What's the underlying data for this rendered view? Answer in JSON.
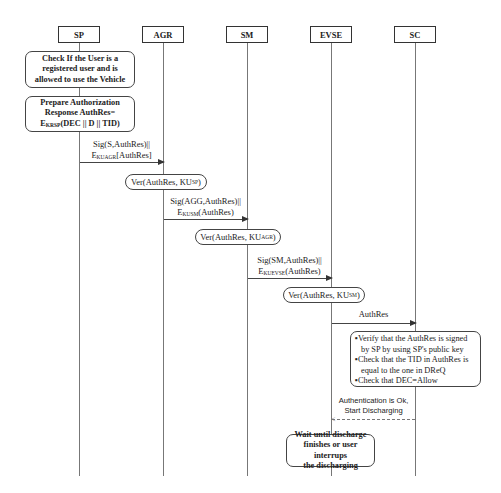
{
  "actors": [
    {
      "id": "SP",
      "label": "SP"
    },
    {
      "id": "AGR",
      "label": "AGR"
    },
    {
      "id": "SM",
      "label": "SM"
    },
    {
      "id": "EVSE",
      "label": "EVSE"
    },
    {
      "id": "SC",
      "label": "SC"
    }
  ],
  "sp_steps": {
    "check_user": "Check If the User is a registered user and is allowed to use the Vehicle",
    "check_user_lines": [
      "Check If the User is a",
      "registered user and is",
      "allowed to use the Vehicle"
    ],
    "prepare_lines": [
      "Prepare Authorization",
      "Response AuthRes="
    ],
    "prepare_enc_main": "E",
    "prepare_enc_sub": "KRSP",
    "prepare_enc_rest": "(DEC || D || TID)"
  },
  "messages": [
    {
      "from": "SP",
      "to": "AGR",
      "line1": "Sig(S,AuthRes)||",
      "enc_sub": "KUAGR",
      "enc_rest": "[AuthRes]"
    },
    {
      "from": "AGR",
      "to": "SM",
      "line1": "Sig(AGG,AuthRes)||",
      "enc_sub": "KUSM",
      "enc_rest": "(AuthRes)"
    },
    {
      "from": "SM",
      "to": "EVSE",
      "line1": "Sig(SM,AuthRes)||",
      "enc_sub": "KUEVSE",
      "enc_rest": "(AuthRes)"
    },
    {
      "from": "EVSE",
      "to": "SC",
      "label": "AuthRes"
    }
  ],
  "verifications": [
    {
      "main": "Ver(AuthRes, KU",
      "sub": "SP",
      "close": ")"
    },
    {
      "main": "Ver(AuthRes, KU",
      "sub": "AGR",
      "close": ")"
    },
    {
      "main": "Ver(AuthRes, KU",
      "sub": "SM",
      "close": ")"
    }
  ],
  "sc_checks": [
    "Verify that the AuthRes is signed by SP by  using SP's public key",
    "Check that the TID in AuthRes is equal to the one in DReQ",
    "Check that DEC=Allow"
  ],
  "reply": {
    "from": "SC",
    "to": "EVSE",
    "line1": "Authentication is Ok,",
    "line2": "Start Discharging",
    "style": "dashed"
  },
  "evse_wait": {
    "lines": [
      "Wait until discharge",
      "finishes or user interrups",
      "the discharging"
    ]
  },
  "colors": {
    "line": "#444444",
    "lifeline": "#777777",
    "background": "#ffffff"
  }
}
